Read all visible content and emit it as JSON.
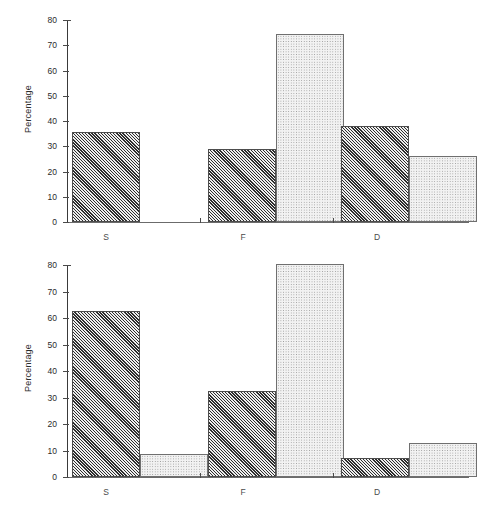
{
  "figure": {
    "background": "#ffffff",
    "series_colors": {
      "series_a": "#6e6e6e",
      "series_b": "#eeeeee"
    }
  },
  "chart_data": [
    {
      "type": "bar",
      "title": "",
      "xlabel": "",
      "ylabel": "Percentage",
      "categories": [
        "S",
        "F",
        "D"
      ],
      "ylim": [
        0,
        80
      ],
      "yticks": [
        0,
        10,
        20,
        30,
        40,
        50,
        60,
        70,
        80
      ],
      "ytick_labels": [
        "0",
        "10",
        "20",
        "30",
        "40",
        "50",
        "60",
        "70",
        "80"
      ],
      "grid": false,
      "legend": "none",
      "series": [
        {
          "name": "Series A",
          "values": [
            35.5,
            29.0,
            38.0
          ]
        },
        {
          "name": "Series B",
          "values": [
            null,
            74.5,
            26.0
          ]
        }
      ]
    },
    {
      "type": "bar",
      "title": "",
      "xlabel": "",
      "ylabel": "Percentage",
      "categories": [
        "S",
        "F",
        "D"
      ],
      "ylim": [
        0,
        80
      ],
      "yticks": [
        0,
        10,
        20,
        30,
        40,
        50,
        60,
        70,
        80
      ],
      "ytick_labels": [
        "0",
        "10",
        "20",
        "30",
        "40",
        "50",
        "60",
        "70",
        "80"
      ],
      "grid": false,
      "legend": "none",
      "series": [
        {
          "name": "Series A",
          "values": [
            62.5,
            32.5,
            7.0
          ]
        },
        {
          "name": "Series B",
          "values": [
            8.5,
            80.5,
            13.0
          ]
        }
      ]
    }
  ]
}
